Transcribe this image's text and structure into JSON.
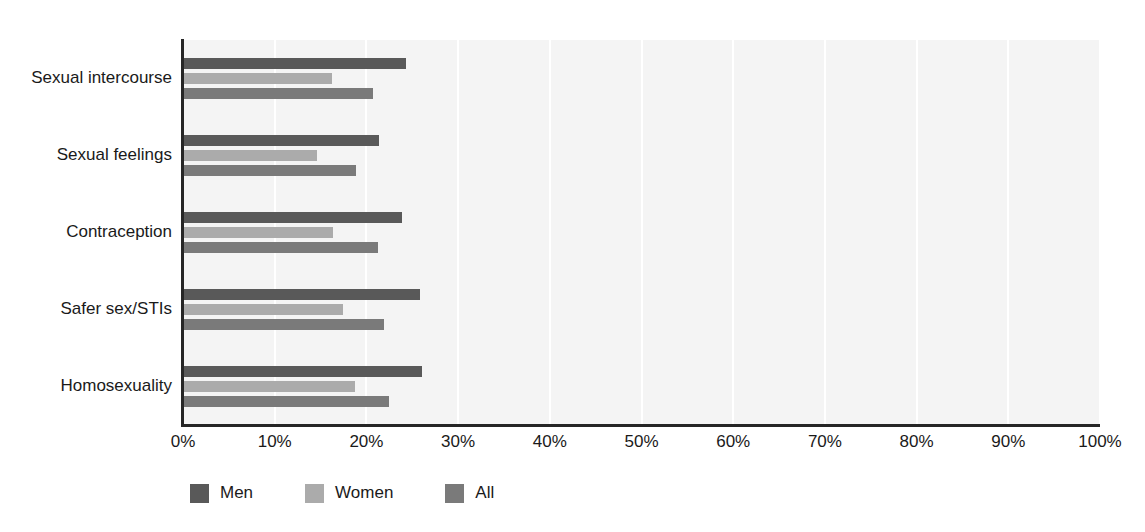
{
  "chart_data": {
    "type": "bar",
    "orientation": "horizontal",
    "title": "",
    "subtitle": "",
    "xlabel": "",
    "ylabel": "",
    "xlim": [
      0,
      100
    ],
    "x_tick_labels": [
      "0%",
      "10%",
      "20%",
      "30%",
      "40%",
      "50%",
      "60%",
      "70%",
      "80%",
      "90%",
      "100%"
    ],
    "x_tick_values": [
      0,
      10,
      20,
      30,
      40,
      50,
      60,
      70,
      80,
      90,
      100
    ],
    "grid": true,
    "grid_axis": "x",
    "legend_position": "bottom-left",
    "categories": [
      "Sexual intercourse",
      "Sexual feelings",
      "Contraception",
      "Safer sex/STIs",
      "Homosexuality"
    ],
    "series": [
      {
        "name": "Men",
        "color": "#595959",
        "values": [
          24.3,
          21.4,
          23.9,
          25.8,
          26.1
        ]
      },
      {
        "name": "Women",
        "color": "#ababab",
        "values": [
          16.2,
          14.6,
          16.4,
          17.4,
          18.8
        ]
      },
      {
        "name": "All",
        "color": "#7a7a7a",
        "values": [
          20.7,
          18.9,
          21.3,
          21.9,
          22.5
        ]
      }
    ]
  },
  "colors": {
    "men": "#595959",
    "women": "#ababab",
    "all": "#7a7a7a",
    "plot_background": "#f4f4f4",
    "gridline": "#ffffff",
    "axis": "#262626",
    "text": "#1a1a1a",
    "page_background": "#ffffff"
  },
  "legend": {
    "items": [
      {
        "label": "Men",
        "color": "#595959"
      },
      {
        "label": "Women",
        "color": "#ababab"
      },
      {
        "label": "All",
        "color": "#7a7a7a"
      }
    ]
  }
}
